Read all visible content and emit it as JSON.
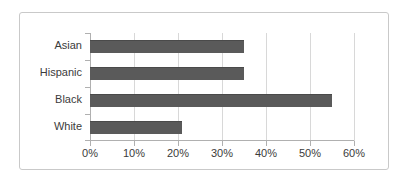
{
  "chart_data": {
    "type": "bar",
    "orientation": "horizontal",
    "title": "",
    "xlabel": "",
    "ylabel": "",
    "categories": [
      "Asian",
      "Hispanic",
      "Black",
      "White"
    ],
    "values": [
      35,
      35,
      55,
      21
    ],
    "value_suffix": "%",
    "xlim": [
      0,
      60
    ],
    "xticks": [
      0,
      10,
      20,
      30,
      40,
      50,
      60
    ],
    "xtick_labels": [
      "0%",
      "10%",
      "20%",
      "30%",
      "40%",
      "50%",
      "60%"
    ],
    "grid": true,
    "grid_axis": "x",
    "legend": false,
    "series": [
      {
        "name": "",
        "values": [
          35,
          35,
          55,
          21
        ]
      }
    ],
    "colors": {
      "bar": "#5a5a5a",
      "bar_edge": "#4a4a4a",
      "gridline": "#d8d8d8",
      "axis": "#b0b0b0",
      "text": "#3b3b3b",
      "frame_border": "#c9c9c9",
      "background": "#ffffff"
    }
  }
}
